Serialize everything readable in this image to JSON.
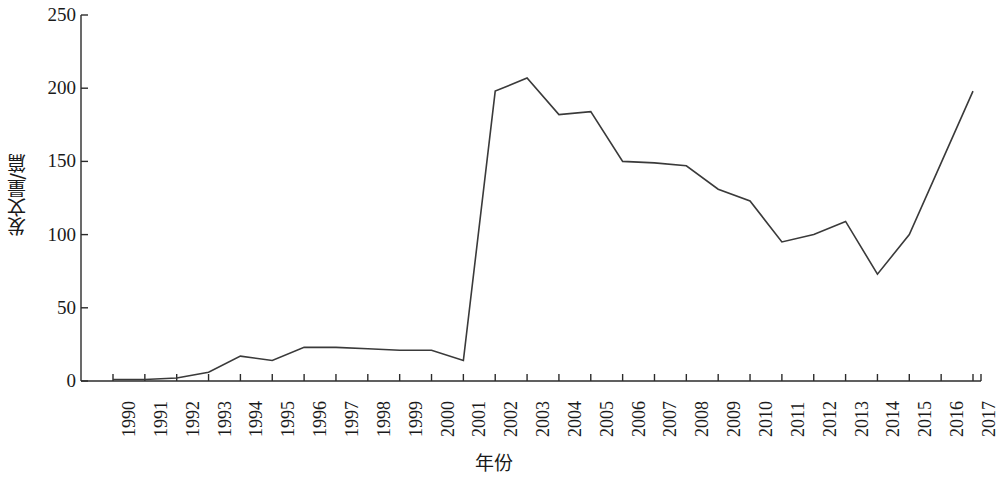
{
  "chart_data": {
    "type": "line",
    "title": "",
    "xlabel": "年份",
    "ylabel": "发文量/篇",
    "categories": [
      "1990",
      "1991",
      "1992",
      "1993",
      "1994",
      "1995",
      "1996",
      "1997",
      "1998",
      "1999",
      "2000",
      "2001",
      "2002",
      "2003",
      "2004",
      "2005",
      "2006",
      "2007",
      "2008",
      "2009",
      "2010",
      "2011",
      "2012",
      "2013",
      "2014",
      "2015",
      "2016",
      "2017"
    ],
    "values": [
      1,
      1,
      2,
      6,
      17,
      14,
      23,
      23,
      22,
      21,
      21,
      14,
      198,
      207,
      182,
      184,
      150,
      149,
      147,
      131,
      123,
      95,
      100,
      109,
      73,
      100,
      149,
      198
    ],
    "series": [
      {
        "name": "发文量",
        "values": [
          1,
          1,
          2,
          6,
          17,
          14,
          23,
          23,
          22,
          21,
          21,
          14,
          198,
          207,
          182,
          184,
          150,
          149,
          147,
          131,
          123,
          95,
          100,
          109,
          73,
          100,
          149,
          198
        ]
      }
    ],
    "ylim": [
      0,
      250
    ],
    "yticks": [
      0,
      50,
      100,
      150,
      200,
      250
    ],
    "ytick_labels": [
      "0",
      "50",
      "100",
      "150",
      "200",
      "250"
    ],
    "grid": false,
    "legend": false,
    "legend_position": "none",
    "line_color": "#3a3a3a",
    "axis_color": "#2b2b2b",
    "background_color": "#ffffff"
  }
}
